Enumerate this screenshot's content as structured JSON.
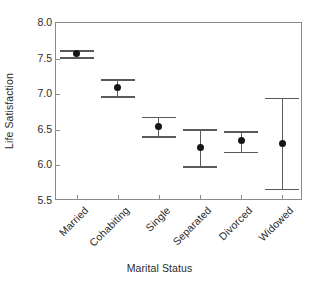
{
  "chart_data": {
    "type": "scatter",
    "title": "",
    "xlabel": "Marital Status",
    "ylabel": "Life Satisfaction",
    "categories": [
      "Married",
      "Cohabiting",
      "Single",
      "Separated",
      "Divorced",
      "Widowed"
    ],
    "values": [
      7.57,
      7.1,
      6.55,
      6.25,
      6.35,
      6.31
    ],
    "error_low": [
      7.52,
      6.97,
      6.41,
      5.99,
      6.19,
      5.67
    ],
    "error_high": [
      7.62,
      7.21,
      6.68,
      6.51,
      6.48,
      6.95
    ],
    "ylim": [
      5.5,
      8.0
    ],
    "ytick_labels": [
      "8.0",
      "7.5",
      "7.0",
      "6.5",
      "6.0",
      "5.5"
    ],
    "ytick_values": [
      8.0,
      7.5,
      7.0,
      6.5,
      6.0,
      5.5
    ],
    "grid": false,
    "legend": null,
    "marker": "filled-circle",
    "errorbar_style": "capped-vertical",
    "colors": {
      "marker": "#151515",
      "errorbar": "#5a5a5a",
      "axis": "#8a8a8a",
      "text": "#2b2b2b",
      "background": "#ffffff"
    }
  }
}
